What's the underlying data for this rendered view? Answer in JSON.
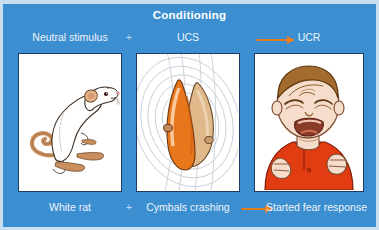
{
  "diagram": {
    "title": "Conditioning",
    "background_color": "#3b8ed0",
    "title_color": "#ffffff",
    "arrow_color": "#e8821f",
    "top_row": {
      "stimulus_label": "Neutral stimulus",
      "plus_1": "+",
      "ucs_label": "UCS",
      "arrow": "arrow-right-icon",
      "ucr_label": "UCR"
    },
    "bottom_row": {
      "stimulus_label": "White rat",
      "plus_1": "+",
      "ucs_label": "Cymbals crashing",
      "arrow": "arrow-right-icon",
      "ucr_label": "Started fear response"
    },
    "panels": [
      {
        "id": "panel-white-rat",
        "illustration": "white-rat-illustration",
        "top_label": "Neutral stimulus",
        "bottom_label": "White rat"
      },
      {
        "id": "panel-cymbals",
        "illustration": "crashing-cymbals-illustration",
        "top_label": "UCS",
        "bottom_label": "Cymbals crashing"
      },
      {
        "id": "panel-crying-baby",
        "illustration": "crying-baby-illustration",
        "top_label": "UCR",
        "bottom_label": "Started fear response"
      }
    ]
  }
}
